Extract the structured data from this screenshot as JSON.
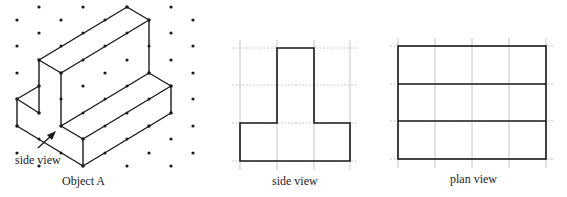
{
  "figures": {
    "object_a": {
      "caption": "Object A",
      "annotation": "side view",
      "grid_dots": [
        [
          39,
          7
        ],
        [
          83,
          7
        ],
        [
          171,
          7
        ],
        [
          17,
          20
        ],
        [
          61,
          20
        ],
        [
          193,
          20
        ],
        [
          39,
          33
        ],
        [
          171,
          33
        ],
        [
          17,
          46
        ],
        [
          193,
          46
        ],
        [
          127,
          60
        ],
        [
          171,
          60
        ],
        [
          17,
          73
        ],
        [
          105,
          73
        ],
        [
          193,
          73
        ],
        [
          193,
          99
        ],
        [
          17,
          153
        ],
        [
          39,
          166
        ],
        [
          149,
          153
        ],
        [
          193,
          153
        ],
        [
          171,
          139
        ],
        [
          127,
          166
        ],
        [
          171,
          166
        ]
      ],
      "vertices": [
        [
          39,
          60
        ],
        [
          61,
          73
        ],
        [
          127,
          7
        ],
        [
          149,
          20
        ],
        [
          149,
          73
        ],
        [
          171,
          86
        ],
        [
          171,
          113
        ],
        [
          83,
          166
        ],
        [
          83,
          139
        ],
        [
          61,
          126
        ],
        [
          39,
          113
        ],
        [
          39,
          86
        ],
        [
          17,
          99
        ],
        [
          17,
          126
        ]
      ]
    },
    "side_view": {
      "caption": "side view",
      "grid_x": [
        240,
        277,
        314,
        350
      ],
      "grid_y": [
        48,
        85,
        123,
        161
      ]
    },
    "plan_view": {
      "caption": "plan view",
      "grid_x": [
        398,
        435,
        472,
        509,
        546
      ],
      "grid_y": [
        46,
        84,
        121,
        159
      ]
    }
  }
}
